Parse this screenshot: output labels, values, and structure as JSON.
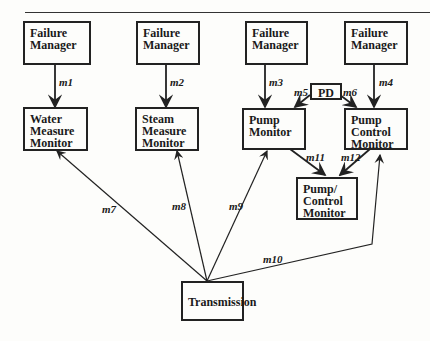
{
  "boxes": {
    "fm1": "Failure Manager",
    "fm2": "Failure Manager",
    "fm3": "Failure Manager",
    "fm4": "Failure Manager",
    "water": "Water Measure Monitor",
    "steam": "Steam Measure Monitor",
    "pump": "Pump Monitor",
    "pumpctl": "Pump Control Monitor",
    "pd": "PD",
    "pumpctl2": "Pump/ Control Monitor",
    "trans": "Transmission"
  },
  "edges": {
    "m1": "m1",
    "m2": "m2",
    "m3": "m3",
    "m4": "m4",
    "m5": "m5",
    "m6": "m6",
    "m7": "m7",
    "m8": "m8",
    "m9": "m9",
    "m10": "m10",
    "m11": "m11",
    "m12": "m12"
  }
}
